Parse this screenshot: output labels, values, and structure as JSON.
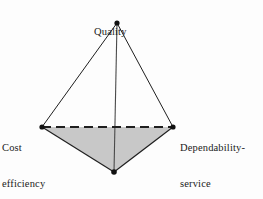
{
  "diagram": {
    "type": "tetrahedron",
    "background_color": "#fdfdfd",
    "edge_color": "#1f1f1f",
    "face_fill_color": "#c8c8c8",
    "vertex_dot_color": "#111111",
    "vertices": [
      {
        "id": "quality",
        "label_lines": [
          "Quality"
        ],
        "x": 117,
        "y": 23,
        "label_position": "above"
      },
      {
        "id": "cost-efficiency",
        "label_lines": [
          "Cost",
          "efficiency"
        ],
        "x": 42,
        "y": 127,
        "label_position": "left"
      },
      {
        "id": "dependability-service",
        "label_lines": [
          "Dependability-",
          "service"
        ],
        "x": 173,
        "y": 127,
        "label_position": "right"
      },
      {
        "id": "flexibility",
        "label_lines": [
          "Flexibility"
        ],
        "x": 114,
        "y": 172,
        "label_position": "below"
      }
    ],
    "edges": [
      {
        "from": "quality",
        "to": "cost-efficiency",
        "style": "solid"
      },
      {
        "from": "quality",
        "to": "dependability-service",
        "style": "solid"
      },
      {
        "from": "quality",
        "to": "flexibility",
        "style": "solid"
      },
      {
        "from": "cost-efficiency",
        "to": "flexibility",
        "style": "solid"
      },
      {
        "from": "dependability-service",
        "to": "flexibility",
        "style": "solid"
      },
      {
        "from": "cost-efficiency",
        "to": "dependability-service",
        "style": "dashed"
      }
    ],
    "shaded_face": {
      "vertices": [
        "cost-efficiency",
        "dependability-service",
        "flexibility"
      ],
      "fill": "#c8c8c8"
    }
  },
  "labels": {
    "quality": {
      "line1": "Quality"
    },
    "cost_efficiency": {
      "line1": "Cost",
      "line2": "efficiency"
    },
    "dependability_service": {
      "line1": "Dependability-",
      "line2": "service"
    },
    "flexibility": {
      "line1": "Flexibility"
    }
  }
}
